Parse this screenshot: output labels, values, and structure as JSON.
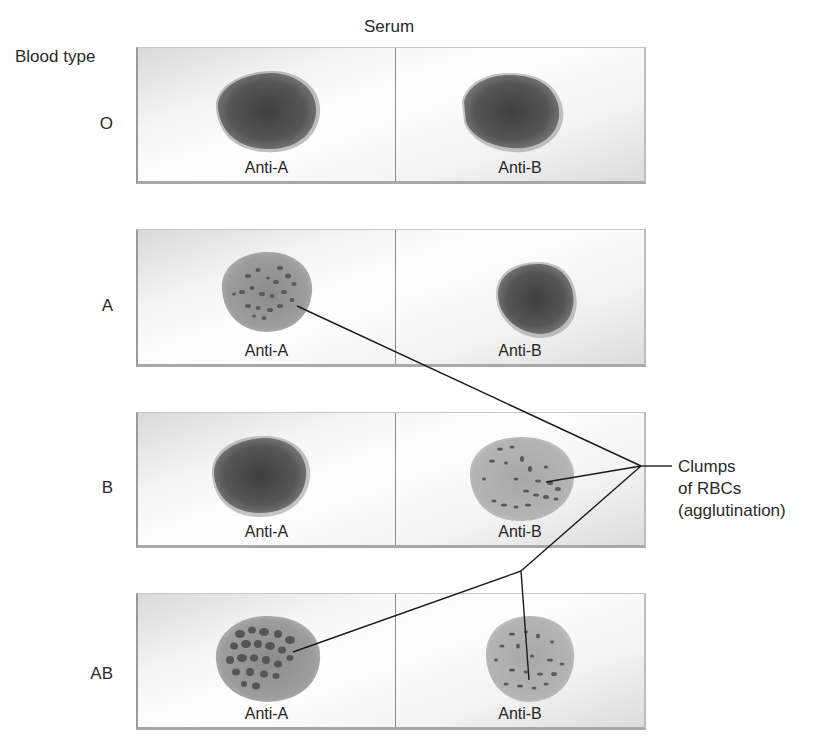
{
  "headers": {
    "serum": "Serum",
    "blood_type": "Blood type"
  },
  "colors": {
    "uniform_drop_dark": "#4b4b4b",
    "uniform_drop_mid": "#6e6e6e",
    "agglutinated_drop": "#9a9a9a",
    "clump": "#565656",
    "leader_line": "#1a1a1a"
  },
  "rows": [
    {
      "blood_type": "O",
      "wells": [
        {
          "serum": "Anti-A",
          "agglutination": false
        },
        {
          "serum": "Anti-B",
          "agglutination": false
        }
      ]
    },
    {
      "blood_type": "A",
      "wells": [
        {
          "serum": "Anti-A",
          "agglutination": true
        },
        {
          "serum": "Anti-B",
          "agglutination": false
        }
      ]
    },
    {
      "blood_type": "B",
      "wells": [
        {
          "serum": "Anti-A",
          "agglutination": false
        },
        {
          "serum": "Anti-B",
          "agglutination": true
        }
      ]
    },
    {
      "blood_type": "AB",
      "wells": [
        {
          "serum": "Anti-A",
          "agglutination": true
        },
        {
          "serum": "Anti-B",
          "agglutination": true
        }
      ]
    }
  ],
  "callout": {
    "line1": "Clumps",
    "line2": "of RBCs",
    "line3": "(agglutination)"
  }
}
